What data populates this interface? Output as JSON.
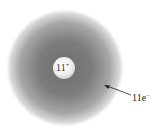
{
  "diagram": {
    "title": "",
    "nucleus": {
      "charge_number": "11",
      "charge_sign": "+"
    },
    "electrons": {
      "count": "11e",
      "charge_sign": "−"
    },
    "colors": {
      "cloud": "#7a7a7a",
      "nucleus": "#f4f4f4",
      "background": "#ffffff",
      "arrow": "#222222"
    }
  }
}
